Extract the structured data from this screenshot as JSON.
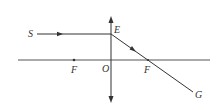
{
  "diagram": {
    "type": "convex-lens-ray-diagram",
    "colors": {
      "line": "#333333",
      "axis": "#555555",
      "background": "#ffffff"
    },
    "labels": {
      "source": "S",
      "incidence_point": "E",
      "optical_center": "O",
      "focus_left": "F",
      "focus_right": "F",
      "ray_end": "G"
    },
    "geometry": {
      "axis": {
        "x1": 18,
        "x2": 210,
        "y": 60
      },
      "lens": {
        "x": 111,
        "y_top": 17,
        "y_bottom": 102
      },
      "incident_ray": {
        "x1": 37,
        "y1": 34,
        "x2": 111,
        "y2": 34
      },
      "refracted_ray": {
        "x1": 111,
        "y1": 34,
        "x2": 193,
        "y2": 92
      },
      "focus_left_x": 74,
      "focus_right_x": 148
    }
  }
}
